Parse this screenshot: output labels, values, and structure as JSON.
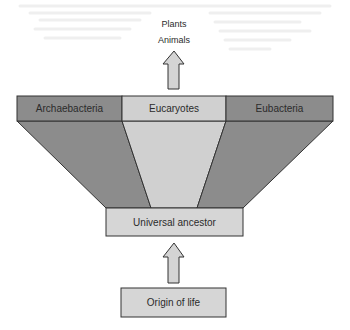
{
  "diagram": {
    "title": "",
    "outputs": {
      "line1": "Plants",
      "line2": "Animals"
    },
    "domains": [
      {
        "label": "Archaebacteria",
        "color": "#8c8c8c"
      },
      {
        "label": "Eucaryotes",
        "color": "#d0d0d0"
      },
      {
        "label": "Eubacteria",
        "color": "#8c8c8c"
      }
    ],
    "ancestor": {
      "label": "Universal ancestor",
      "color": "#d6d6d6"
    },
    "origin": {
      "label": "Origin of life",
      "color": "#d6d6d6"
    },
    "colors": {
      "stroke": "#333333",
      "arrow_fill": "#d4d4d4",
      "bleed_text": "#efefef"
    },
    "edges": [
      {
        "from": "Origin of life",
        "to": "Universal ancestor",
        "type": "arrow"
      },
      {
        "from": "Universal ancestor",
        "to": "Archaebacteria",
        "type": "funnel"
      },
      {
        "from": "Universal ancestor",
        "to": "Eucaryotes",
        "type": "funnel"
      },
      {
        "from": "Universal ancestor",
        "to": "Eubacteria",
        "type": "funnel"
      },
      {
        "from": "Eucaryotes",
        "to": "Plants / Animals",
        "type": "arrow"
      }
    ]
  }
}
